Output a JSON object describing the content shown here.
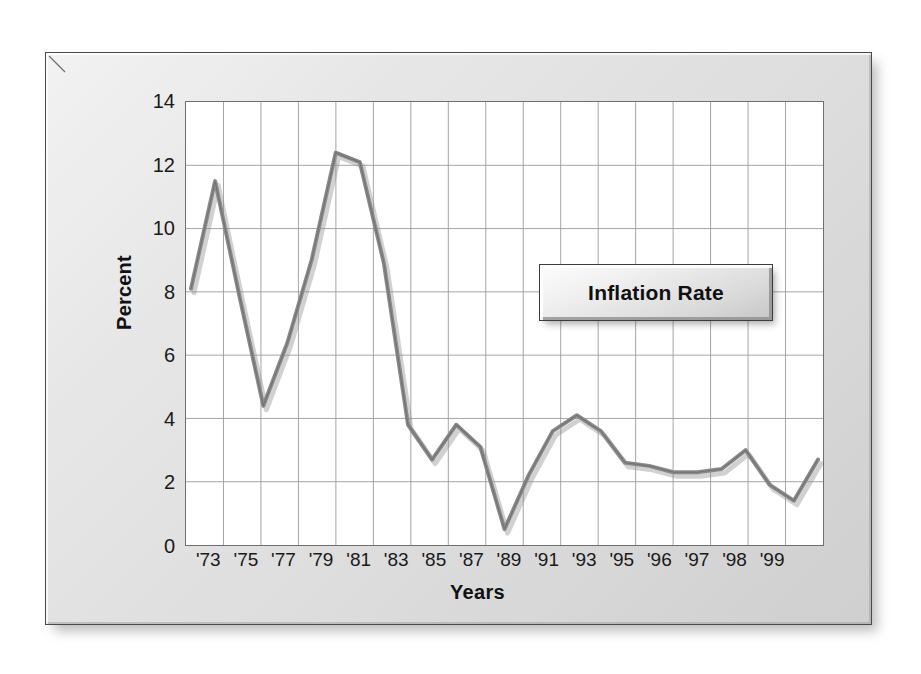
{
  "figure": {
    "panel_background": "#dcdcdc",
    "plot_background": "#ffffff",
    "border_color": "#4a4a4a"
  },
  "legend": {
    "label": "Inflation Rate",
    "position": "inside-upper-right"
  },
  "chart_data": {
    "type": "line",
    "title": "",
    "subtitle": "",
    "xlabel": "Years",
    "ylabel": "Percent",
    "series_name": "Inflation Rate",
    "line_color": "#8a8a8a",
    "line_width": 4,
    "grid": true,
    "xlim": [
      1972.5,
      1999.5
    ],
    "ylim": [
      0,
      14
    ],
    "yticks": [
      0,
      2,
      4,
      6,
      8,
      10,
      12,
      14
    ],
    "ytick_labels": [
      "0",
      "2",
      "4",
      "6",
      "8",
      "10",
      "12",
      "14"
    ],
    "xtick_labels": [
      "'73",
      "'75",
      "'77",
      "'79",
      "'81",
      "'83",
      "'85",
      "'87",
      "'89",
      "'91",
      "'93",
      "'95",
      "'96",
      "'97",
      "'98",
      "'99"
    ],
    "x": [
      1973,
      1974,
      1975,
      1976,
      1977,
      1978,
      1979,
      1980,
      1981,
      1982,
      1983,
      1984,
      1985,
      1986,
      1987,
      1988,
      1989,
      1990,
      1991,
      1992,
      1993,
      1994,
      1995,
      1996,
      1997,
      1998,
      1999
    ],
    "categories": [
      "1973",
      "1974",
      "1975",
      "1976",
      "1977",
      "1978",
      "1979",
      "1980",
      "1981",
      "1982",
      "1983",
      "1984",
      "1985",
      "1986",
      "1987",
      "1988",
      "1989",
      "1990",
      "1991",
      "1992",
      "1993",
      "1994",
      "1995",
      "1996",
      "1997",
      "1998",
      "1999"
    ],
    "values": [
      8.1,
      11.5,
      7.9,
      4.4,
      6.4,
      9.0,
      12.4,
      12.1,
      8.9,
      3.8,
      2.7,
      3.8,
      3.1,
      0.5,
      2.2,
      3.6,
      4.1,
      3.6,
      2.6,
      2.5,
      2.3,
      2.3,
      2.4,
      3.0,
      1.9,
      1.4,
      2.7
    ],
    "legend_entries": [
      "Inflation Rate"
    ],
    "legend_position": "inside-upper-right"
  },
  "axis": {
    "y_title": "Percent",
    "x_title": "Years"
  }
}
